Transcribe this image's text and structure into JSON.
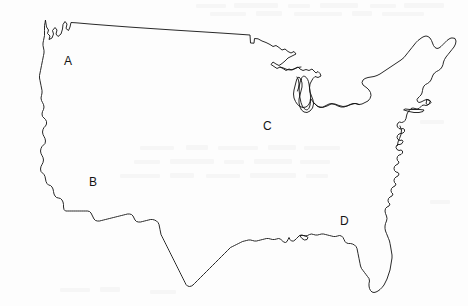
{
  "document": {
    "type": "outline-map-worksheet",
    "subject": "Contiguous United States",
    "title": "United States Outline Map",
    "background_color": "#fdfdfd",
    "outline_color": "#111111",
    "label_color": "#141414",
    "width_px": 468,
    "height_px": 306
  },
  "map": {
    "name": "united-states-outline",
    "projection_note": "blank political outline, no state borders, no labels except letters",
    "features_visible": [
      "pacific-coast",
      "puget-sound",
      "san-francisco-bay",
      "mexico-border-steps",
      "texas-gulf-coast",
      "mississippi-delta",
      "florida-peninsula",
      "atlantic-coast",
      "chesapeake-bay",
      "cape-cod",
      "long-island",
      "maine",
      "great-lakes",
      "lake-superior",
      "lake-michigan",
      "lake-huron",
      "lake-erie",
      "lake-ontario",
      "canada-border"
    ]
  },
  "labels": [
    {
      "id": "A",
      "text": "A",
      "region_hint": "pacific-northwest",
      "x": 68,
      "y": 62
    },
    {
      "id": "B",
      "text": "B",
      "region_hint": "southwest",
      "x": 93,
      "y": 183
    },
    {
      "id": "C",
      "text": "C",
      "region_hint": "midwest",
      "x": 267,
      "y": 127
    },
    {
      "id": "D",
      "text": "D",
      "region_hint": "southeast-gulf",
      "x": 344,
      "y": 222
    }
  ]
}
